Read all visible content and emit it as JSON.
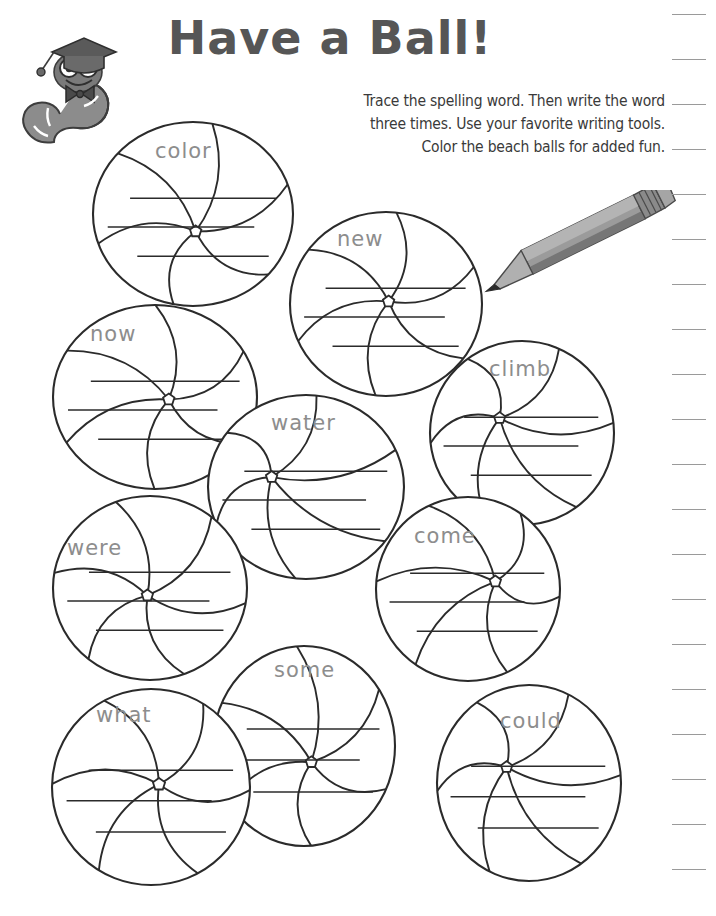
{
  "worksheet": {
    "title": "Have a Ball!",
    "instructions": [
      "Trace the spelling word. Then write the word",
      "three times. Use your favorite writing tools.",
      "Color the beach balls for added fun."
    ],
    "title_color": "#565656",
    "ink_color": "#2b2b2b",
    "trace_word_color": "#8d8d8d",
    "writing_lines_per_ball": 3
  },
  "illustrations": {
    "worm": "bookworm-with-graduation-cap-icon",
    "pencil": "pencil-icon"
  },
  "ruler": {
    "tick_count": 20,
    "first_tick_y": 14,
    "tick_spacing": 45
  },
  "balls": [
    {
      "word": "color",
      "cx": 193,
      "cy": 214,
      "rx": 100,
      "ry": 92,
      "hub_x": 0.52,
      "hub_y": 0.64,
      "word_x": 155,
      "word_y": 139
    },
    {
      "word": "new",
      "cx": 386,
      "cy": 304,
      "rx": 96,
      "ry": 92,
      "hub_x": 0.52,
      "hub_y": 0.48,
      "word_x": 337,
      "word_y": 227
    },
    {
      "word": "now",
      "cx": 155,
      "cy": 397,
      "rx": 102,
      "ry": 92,
      "hub_x": 0.6,
      "hub_y": 0.52,
      "word_x": 90,
      "word_y": 322
    },
    {
      "word": "climb",
      "cx": 522,
      "cy": 433,
      "rx": 92,
      "ry": 92,
      "hub_x": 0.32,
      "hub_y": 0.38,
      "word_x": 489,
      "word_y": 357
    },
    {
      "word": "water",
      "cx": 306,
      "cy": 487,
      "rx": 98,
      "ry": 92,
      "hub_x": 0.24,
      "hub_y": 0.42,
      "word_x": 271,
      "word_y": 411
    },
    {
      "word": "were",
      "cx": 150,
      "cy": 588,
      "rx": 97,
      "ry": 92,
      "hub_x": 0.48,
      "hub_y": 0.56,
      "word_x": 67,
      "word_y": 536
    },
    {
      "word": "come",
      "cx": 468,
      "cy": 589,
      "rx": 92,
      "ry": 92,
      "hub_x": 0.72,
      "hub_y": 0.44,
      "word_x": 414,
      "word_y": 524
    },
    {
      "word": "some",
      "cx": 304,
      "cy": 746,
      "rx": 91,
      "ry": 100,
      "hub_x": 0.56,
      "hub_y": 0.62,
      "word_x": 274,
      "word_y": 658
    },
    {
      "word": "what",
      "cx": 151,
      "cy": 787,
      "rx": 99,
      "ry": 98,
      "hub_x": 0.56,
      "hub_y": 0.48,
      "word_x": 96,
      "word_y": 703
    },
    {
      "word": "could",
      "cx": 529,
      "cy": 783,
      "rx": 92,
      "ry": 98,
      "hub_x": 0.32,
      "hub_y": 0.38,
      "word_x": 500,
      "word_y": 709
    }
  ]
}
